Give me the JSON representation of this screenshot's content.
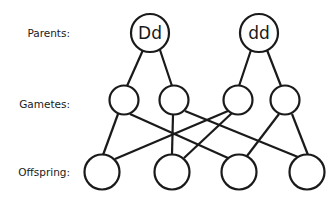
{
  "labels": {
    "parents": "Parents:",
    "gametes": "Gametes:",
    "offspring": "Offspring:"
  },
  "parents": [
    {
      "id": "P1",
      "genotype": "Dd"
    },
    {
      "id": "P2",
      "genotype": "dd"
    }
  ],
  "gametes": [
    {
      "id": "G1",
      "allele": "",
      "parent": "P1"
    },
    {
      "id": "G2",
      "allele": "",
      "parent": "P1"
    },
    {
      "id": "G3",
      "allele": "",
      "parent": "P2"
    },
    {
      "id": "G4",
      "allele": "",
      "parent": "P2"
    }
  ],
  "offspring": [
    {
      "id": "O1",
      "genotype": ""
    },
    {
      "id": "O2",
      "genotype": ""
    },
    {
      "id": "O3",
      "genotype": ""
    },
    {
      "id": "O4",
      "genotype": ""
    }
  ],
  "edges": [
    [
      "P1",
      "G1"
    ],
    [
      "P1",
      "G2"
    ],
    [
      "P2",
      "G3"
    ],
    [
      "P2",
      "G4"
    ],
    [
      "G1",
      "O1"
    ],
    [
      "G1",
      "O3"
    ],
    [
      "G2",
      "O2"
    ],
    [
      "G2",
      "O4"
    ],
    [
      "G3",
      "O1"
    ],
    [
      "G3",
      "O2"
    ],
    [
      "G4",
      "O3"
    ],
    [
      "G4",
      "O4"
    ]
  ]
}
